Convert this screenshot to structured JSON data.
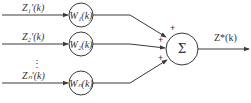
{
  "diagram": {
    "inputs": [
      {
        "label": "Z₁′(k)",
        "weight": "W₁(k)",
        "sign": "+"
      },
      {
        "label": "Z₂′(k)",
        "weight": "W₂(k)",
        "sign": "+"
      },
      {
        "label": "Zₙ′(k)",
        "weight": "Wₙ(k)",
        "sign": "+"
      }
    ],
    "ellipsis": "⋮",
    "summer": {
      "symbol": "Σ"
    },
    "output": {
      "label": "Z*(k)"
    },
    "colors": {
      "stroke": "#3a3a3a",
      "text": "#333333"
    }
  }
}
